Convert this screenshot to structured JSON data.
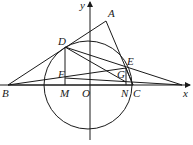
{
  "diagram": {
    "type": "geometry",
    "points": {
      "A": {
        "label": "A",
        "x": 106,
        "y": 21
      },
      "B": {
        "label": "B",
        "x": 8,
        "y": 85
      },
      "C": {
        "label": "C",
        "x": 133,
        "y": 85
      },
      "D": {
        "label": "D",
        "x": 65,
        "y": 47
      },
      "E": {
        "label": "E",
        "x": 126,
        "y": 68
      },
      "F": {
        "label": "F",
        "x": 65,
        "y": 78
      },
      "G": {
        "label": "G",
        "x": 125,
        "y": 73
      },
      "M": {
        "label": "M",
        "x": 65,
        "y": 85
      },
      "N": {
        "label": "N",
        "x": 126,
        "y": 85
      },
      "O": {
        "label": "O",
        "x": 90,
        "y": 85
      }
    },
    "axes": {
      "x_label": "x",
      "y_label": "y"
    },
    "circle": {
      "center": "O",
      "cx": 88,
      "cy": 85,
      "r": 44
    }
  }
}
